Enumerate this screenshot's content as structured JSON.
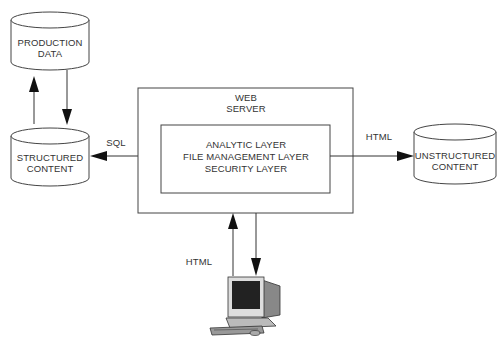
{
  "diagram": {
    "nodes": {
      "production_data": {
        "line1": "PRODUCTION",
        "line2": "DATA"
      },
      "structured_content": {
        "line1": "STRUCTURED",
        "line2": "CONTENT"
      },
      "unstructured_content": {
        "line1": "UNSTRUCTURED",
        "line2": "CONTENT"
      },
      "web_server": {
        "line1": "WEB",
        "line2": "SERVER"
      },
      "layers": {
        "line1": "ANALYTIC LAYER",
        "line2": "FILE MANAGEMENT LAYER",
        "line3": "SECURITY LAYER"
      },
      "client": {
        "icon": "desktop-computer-icon"
      }
    },
    "edges": {
      "sql_label": "SQL",
      "html_right_label": "HTML",
      "html_bottom_label": "HTML"
    }
  }
}
